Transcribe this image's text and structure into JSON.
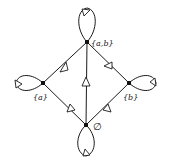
{
  "diagram": {
    "type": "directed-graph",
    "nodes": [
      {
        "id": "ab",
        "label": "{a,b}",
        "x": 87,
        "y": 42
      },
      {
        "id": "a",
        "label": "{a}",
        "x": 43,
        "y": 83
      },
      {
        "id": "b",
        "label": "{b}",
        "x": 129,
        "y": 83
      },
      {
        "id": "empty",
        "label": "∅",
        "x": 86,
        "y": 125
      }
    ],
    "edges": [
      {
        "from": "empty",
        "to": "a"
      },
      {
        "from": "empty",
        "to": "b"
      },
      {
        "from": "empty",
        "to": "ab"
      },
      {
        "from": "a",
        "to": "ab"
      },
      {
        "from": "b",
        "to": "ab"
      },
      {
        "from": "ab",
        "to": "ab",
        "loop": "up"
      },
      {
        "from": "a",
        "to": "a",
        "loop": "left"
      },
      {
        "from": "b",
        "to": "b",
        "loop": "right"
      },
      {
        "from": "empty",
        "to": "empty",
        "loop": "down"
      }
    ],
    "labels": {
      "ab": "{a,b}",
      "a": "{a}",
      "b": "{b}",
      "empty": "∅"
    }
  }
}
